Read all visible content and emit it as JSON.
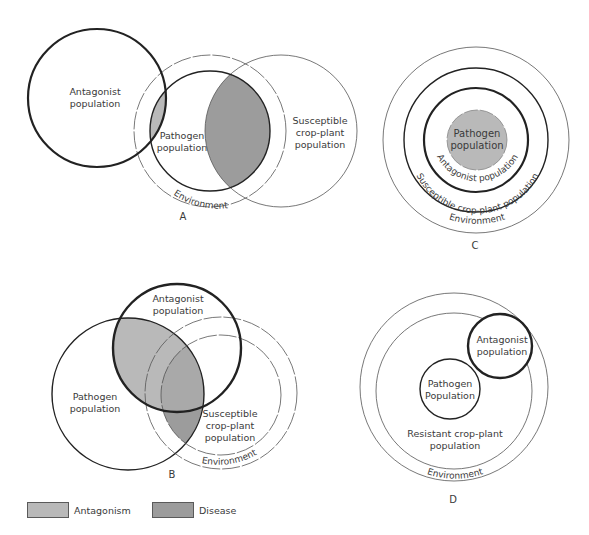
{
  "colors": {
    "antagonism": "#b9b9b9",
    "disease": "#9c9c9c",
    "stroke": "#222222",
    "thin_stroke": "#555555"
  },
  "panels": {
    "A": {
      "label": "A",
      "antagonist": "Antagonist population",
      "antagonist_l1": "Antagonist",
      "antagonist_l2": "population",
      "pathogen_l1": "Pathogen",
      "pathogen_l2": "population",
      "crop_l1": "Susceptible",
      "crop_l2": "crop-plant",
      "crop_l3": "population",
      "environment": "Environment"
    },
    "B": {
      "label": "B",
      "antagonist_l1": "Antagonist",
      "antagonist_l2": "population",
      "pathogen_l1": "Pathogen",
      "pathogen_l2": "population",
      "crop_l1": "Susceptible",
      "crop_l2": "crop-plant",
      "crop_l3": "population",
      "environment": "Environment"
    },
    "C": {
      "label": "C",
      "pathogen_l1": "Pathogen",
      "pathogen_l2": "population",
      "antagonist": "Antagonist population",
      "crop": "Susceptible crop-plant population",
      "environment": "Environment"
    },
    "D": {
      "label": "D",
      "antagonist_l1": "Antagonist",
      "antagonist_l2": "population",
      "pathogen_l1": "Pathogen",
      "pathogen_l2": "Population",
      "crop_l1": "Resistant crop-plant",
      "crop_l2": "population",
      "environment": "Environment"
    }
  },
  "legend": [
    {
      "label": "Antagonism",
      "color": "#b9b9b9"
    },
    {
      "label": "Disease",
      "color": "#9c9c9c"
    }
  ]
}
